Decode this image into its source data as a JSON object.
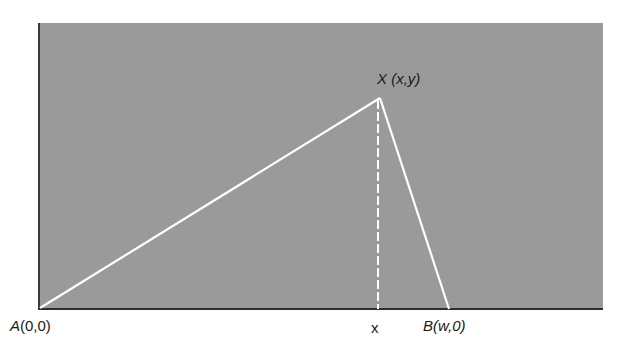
{
  "diagram": {
    "type": "triangle-geometry",
    "background_color": "#9a9a9a",
    "line_color": "#ffffff",
    "points": {
      "A": {
        "label_name": "A",
        "coords": "(0,0)"
      },
      "X": {
        "label_name": "X",
        "coords": "(x,y)"
      },
      "B": {
        "label_name": "B",
        "coords": "(w,0)"
      }
    },
    "foot_label": "x",
    "segments": [
      {
        "from": "A",
        "to": "X",
        "style": "solid"
      },
      {
        "from": "X",
        "to": "B",
        "style": "solid"
      },
      {
        "from": "X",
        "to": "foot",
        "style": "dashed"
      }
    ]
  }
}
